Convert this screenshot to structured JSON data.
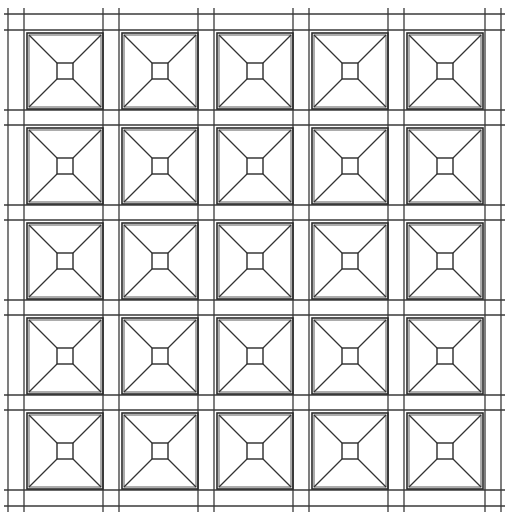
{
  "drawing": {
    "title": "",
    "description": "5x5 grid of pyramidal coffer squares (line drawing)",
    "rows": 5,
    "cols": 5,
    "colors": {
      "background": "#ffffff",
      "line": "#2b2b2b"
    },
    "grid": {
      "vertical_lines_x": [
        8,
        24,
        103,
        119,
        198,
        214,
        293,
        309,
        388,
        404,
        485,
        501
      ],
      "horizontal_lines_y": [
        14,
        30,
        110,
        125,
        205,
        220,
        300,
        315,
        395,
        410,
        490,
        506
      ],
      "extent": {
        "x1": 4,
        "y1": 8,
        "x2": 505,
        "y2": 512
      }
    },
    "tiles": {
      "size": 76,
      "inner_size": 16,
      "col_x": [
        27,
        122,
        217,
        312,
        407
      ],
      "row_y": [
        33,
        128,
        223,
        318,
        413
      ]
    }
  }
}
